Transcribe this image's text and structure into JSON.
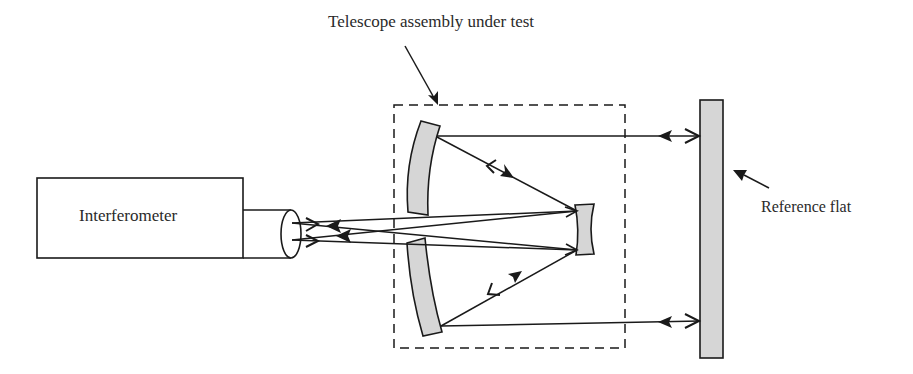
{
  "diagram": {
    "title": "Telescope assembly under test",
    "components": {
      "interferometer": {
        "label": "Interferometer"
      },
      "reference_flat": {
        "label": "Reference flat"
      },
      "telescope_assembly": {
        "label": "Telescope assembly under test"
      },
      "upper_primary_mirror": {
        "label": ""
      },
      "lower_primary_mirror": {
        "label": ""
      },
      "secondary_mirror": {
        "label": ""
      },
      "lens": {
        "label": ""
      }
    },
    "colors": {
      "stroke": "#1a1a1a",
      "mirror_fill": "#d6d6d6",
      "background": "#ffffff"
    }
  }
}
